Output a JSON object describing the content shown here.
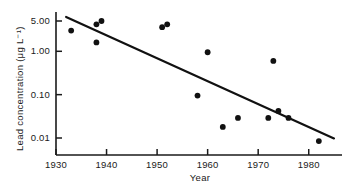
{
  "chart_data": {
    "type": "scatter",
    "title": "",
    "xlabel": "Year",
    "ylabel": "Lead concentration (μg L⁻¹)",
    "xlim": [
      1930,
      1985
    ],
    "ylim": [
      0.005,
      7.0
    ],
    "yscale": "log",
    "grid": false,
    "legend": null,
    "xticks": [
      1930,
      1940,
      1950,
      1960,
      1970,
      1980
    ],
    "xticklabels": [
      "1930",
      "1940",
      "1950",
      "1960",
      "1970",
      "1980"
    ],
    "yticks": [
      5.0,
      1.0,
      0.1,
      0.01
    ],
    "yticklabels": [
      "5.00",
      "1.00",
      "0.10",
      "0.01"
    ],
    "series": [
      {
        "name": "Lead concentration",
        "marker": "filled-circle",
        "points": [
          {
            "x": 1933,
            "y": 3.0
          },
          {
            "x": 1938,
            "y": 4.2
          },
          {
            "x": 1938,
            "y": 1.6
          },
          {
            "x": 1939,
            "y": 5.0
          },
          {
            "x": 1951,
            "y": 3.6
          },
          {
            "x": 1952,
            "y": 4.2
          },
          {
            "x": 1958,
            "y": 0.095
          },
          {
            "x": 1960,
            "y": 0.95
          },
          {
            "x": 1963,
            "y": 0.018
          },
          {
            "x": 1966,
            "y": 0.029
          },
          {
            "x": 1972,
            "y": 0.029
          },
          {
            "x": 1973,
            "y": 0.6
          },
          {
            "x": 1974,
            "y": 0.042
          },
          {
            "x": 1976,
            "y": 0.029
          },
          {
            "x": 1982,
            "y": 0.0085
          }
        ]
      }
    ],
    "trendline": {
      "name": "fitted regression line",
      "x_start": 1932,
      "y_start": 6.2,
      "x_end": 1985,
      "y_end": 0.0098
    }
  }
}
